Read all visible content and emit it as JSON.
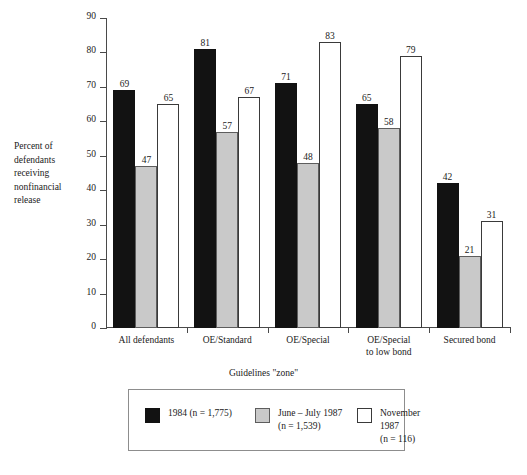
{
  "chart_data": {
    "type": "bar",
    "title": "",
    "xlabel": "Guidelines \"zone\"",
    "ylabel": "Percent of defendants receiving nonfinancial release",
    "ylim": [
      0,
      90
    ],
    "ytick_step": 10,
    "yticks": [
      0,
      10,
      20,
      30,
      40,
      50,
      60,
      70,
      80,
      90
    ],
    "grid": false,
    "legend_position": "bottom",
    "categories": [
      "All defendants",
      "OE/Standard",
      "OE/Special",
      "OE/Special to low bond",
      "Secured bond"
    ],
    "series": [
      {
        "name": "1984 (n = 1,775)",
        "color": "#121212",
        "values": [
          69,
          81,
          71,
          65,
          42
        ]
      },
      {
        "name": "June – July 1987 (n = 1,539)",
        "color": "#c9c9c9",
        "values": [
          47,
          57,
          48,
          58,
          21
        ]
      },
      {
        "name": "November 1987 (n = 116)",
        "color": "#ffffff",
        "values": [
          65,
          67,
          83,
          79,
          31
        ]
      }
    ]
  },
  "axis": {
    "ylabel_lines": [
      "Percent of",
      "defendants",
      "receiving",
      "nonfinancial",
      "release"
    ],
    "xtitle": "Guidelines \"zone\"",
    "ytick_labels": [
      "90",
      "80",
      "70",
      "60",
      "50",
      "40",
      "30",
      "20",
      "10",
      "0"
    ]
  },
  "groups": [
    {
      "caption_lines": [
        "All defendants"
      ],
      "values": [
        69,
        47,
        65
      ]
    },
    {
      "caption_lines": [
        "OE/Standard"
      ],
      "values": [
        81,
        57,
        67
      ]
    },
    {
      "caption_lines": [
        "OE/Special"
      ],
      "values": [
        71,
        48,
        83
      ]
    },
    {
      "caption_lines": [
        "OE/Special",
        "to low bond"
      ],
      "values": [
        65,
        58,
        79
      ]
    },
    {
      "caption_lines": [
        "Secured bond"
      ],
      "values": [
        42,
        21,
        31
      ]
    }
  ],
  "legend": {
    "entries": [
      {
        "swatch": "black",
        "label": "1984 (n = 1,775)"
      },
      {
        "swatch": "gray",
        "label": "June – July 1987\n(n = 1,539)"
      },
      {
        "swatch": "white",
        "label": "November 1987\n(n = 116)"
      }
    ]
  }
}
